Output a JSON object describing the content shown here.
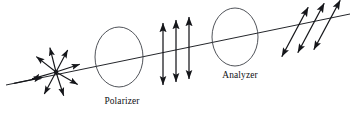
{
  "figure": {
    "background_color": "#ffffff",
    "ink_color": "#15161a",
    "width": 356,
    "height": 118
  },
  "labels": {
    "polarizer": "Polarizer",
    "analyzer": "Analyzer"
  },
  "optics": [
    {
      "name": "polarizer",
      "label": "Polarizer",
      "shape": "ellipse",
      "cx": 119,
      "cy": 57,
      "rx": 24,
      "ry": 30,
      "label_x": 122,
      "label_y": 104
    },
    {
      "name": "analyzer",
      "label": "Analyzer",
      "shape": "ellipse",
      "cx": 235,
      "cy": 37,
      "rx": 23,
      "ry": 29,
      "label_x": 240,
      "label_y": 78
    }
  ],
  "beam_axis": {
    "name": "optical-axis",
    "x1": 6,
    "y1": 85,
    "x2": 350,
    "y2": 14,
    "head_x": 40,
    "head_y": 78,
    "description": "Propagation axis of the light beam, arrow points to the right"
  },
  "unpolarized_light": {
    "name": "unpolarized-light-starburst",
    "center_x": 56,
    "center_y": 72,
    "dot_radius": 2.2,
    "arrow_count": 8,
    "arrow_length": 25,
    "angles_deg": [
      18,
      62,
      104,
      142,
      196,
      242,
      288,
      330
    ],
    "description": "Randomly oriented electric field vectors of unpolarized light"
  },
  "polarized_beam_vertical": {
    "name": "linearly-polarized-vertical",
    "arrow_count": 3,
    "orientation_deg": 90,
    "length": 62,
    "arrows": [
      {
        "cx": 163,
        "cy": 54
      },
      {
        "cx": 176,
        "cy": 51
      },
      {
        "cx": 189,
        "cy": 48
      }
    ],
    "description": "Vertically oscillating double headed arrows after the polarizer"
  },
  "polarized_beam_tilted": {
    "name": "linearly-polarized-tilted",
    "arrow_count": 3,
    "orientation_deg": 62,
    "length": 56,
    "arrows": [
      {
        "cx": 295,
        "cy": 32
      },
      {
        "cx": 311,
        "cy": 28
      },
      {
        "cx": 327,
        "cy": 25
      }
    ],
    "description": "Tilted double headed arrows transmitted by the analyzer"
  }
}
